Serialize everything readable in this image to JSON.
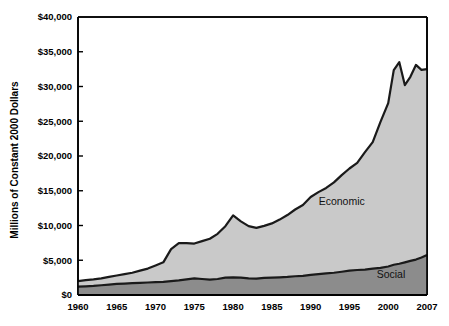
{
  "chart_data": {
    "type": "area",
    "stacked": true,
    "title": "",
    "xlabel": "",
    "ylabel": "Millions of Constant 2000 Dollars",
    "xlim": [
      1960,
      2007
    ],
    "ylim": [
      0,
      40000
    ],
    "ytick_labels": [
      "$0",
      "$5,000",
      "$10,000",
      "$15,000",
      "$20,000",
      "$25,000",
      "$30,000",
      "$35,000",
      "$40,000"
    ],
    "ytick_values": [
      0,
      5000,
      10000,
      15000,
      20000,
      25000,
      30000,
      35000,
      40000
    ],
    "xtick_labels": [
      "1960",
      "1965",
      "1970",
      "1975",
      "1980",
      "1985",
      "1990",
      "1995",
      "2000",
      "2007"
    ],
    "xtick_values": [
      1960,
      1965,
      1970,
      1975,
      1980,
      1985,
      1990,
      1995,
      2000,
      2007
    ],
    "grid": false,
    "legend_position": "inline-annotations",
    "annotations": [
      {
        "text": "Economic",
        "x": 1994.0,
        "y": 13000
      },
      {
        "text": "Social",
        "x": 2000.5,
        "y": 2400
      }
    ],
    "x": [
      1960,
      1961,
      1962,
      1963,
      1964,
      1965,
      1966,
      1967,
      1968,
      1969,
      1970,
      1971,
      1972,
      1973,
      1974,
      1975,
      1976,
      1977,
      1978,
      1979,
      1980,
      1981,
      1982,
      1983,
      1984,
      1985,
      1986,
      1987,
      1988,
      1989,
      1990,
      1991,
      1992,
      1993,
      1994,
      1995,
      1996,
      1997,
      1998,
      1999,
      2000,
      2001,
      2002,
      2003,
      2004,
      2005,
      2006,
      2007
    ],
    "series": [
      {
        "name": "Social",
        "color": "#8c8c8c",
        "values": [
          1200,
          1250,
          1300,
          1400,
          1500,
          1600,
          1650,
          1700,
          1750,
          1800,
          1850,
          1900,
          2000,
          2100,
          2250,
          2400,
          2300,
          2200,
          2300,
          2500,
          2550,
          2500,
          2400,
          2350,
          2450,
          2500,
          2550,
          2600,
          2700,
          2750,
          2900,
          3000,
          3100,
          3200,
          3350,
          3500,
          3600,
          3650,
          3800,
          3900,
          4100,
          4350,
          4500,
          4700,
          4900,
          5100,
          5400,
          5750
        ]
      },
      {
        "name": "Economic",
        "color": "#c9c9c9",
        "values": [
          800,
          900,
          950,
          1000,
          1100,
          1200,
          1350,
          1500,
          1750,
          2000,
          2400,
          2800,
          4600,
          5350,
          5200,
          5000,
          5450,
          5900,
          6500,
          7400,
          8900,
          8100,
          7500,
          7300,
          7500,
          7800,
          8300,
          8900,
          9600,
          10200,
          11200,
          11800,
          12300,
          13000,
          13900,
          14700,
          15400,
          16900,
          18200,
          21000,
          23500,
          28000,
          29000,
          25500,
          26500,
          28000,
          27000,
          26750
        ]
      }
    ],
    "totals": [
      2000,
      2150,
      2250,
      2400,
      2600,
      2800,
      3000,
      3200,
      3500,
      3800,
      4250,
      4700,
      6600,
      7450,
      7450,
      7400,
      7750,
      8100,
      8800,
      9900,
      11450,
      10600,
      9900,
      9650,
      9950,
      10300,
      10850,
      11500,
      12300,
      12950,
      14100,
      14800,
      15400,
      16200,
      17250,
      18200,
      19000,
      20550,
      22000,
      24900,
      27600,
      32350,
      33500,
      30200,
      31400,
      33100,
      32400,
      32500
    ],
    "notes": {
      "peak_year": 2002,
      "peak_total": 33500,
      "end_year": 2007,
      "end_total": 32500,
      "start_year": 1960,
      "start_total": 2000
    }
  },
  "axis": {
    "y_title": "Millions of Constant 2000 Dollars"
  },
  "labels": {
    "economic": "Economic",
    "social": "Social"
  },
  "colors": {
    "economic_fill": "#c9c9c9",
    "social_fill": "#8c8c8c",
    "line": "#1a1a1a",
    "axis": "#000000",
    "background": "#ffffff"
  }
}
